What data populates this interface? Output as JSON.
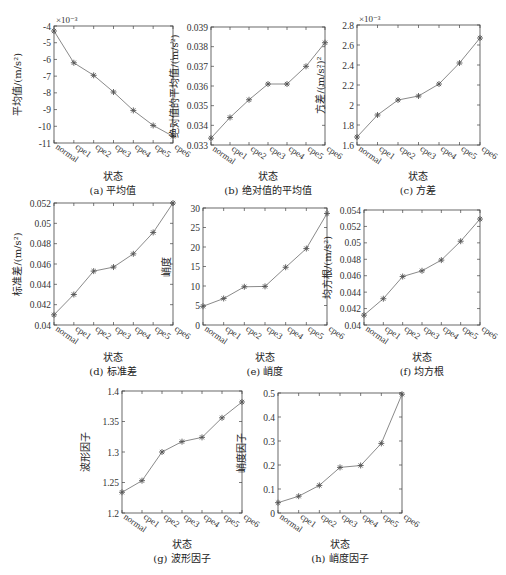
{
  "chart_data": [
    {
      "id": "a",
      "type": "line",
      "title": "",
      "caption": "(a) 平均值",
      "xlabel": "状态",
      "ylabel": "平均值/(m/s²)",
      "categories": [
        "normal",
        "cpe1",
        "cpe2",
        "cpe3",
        "cpe4",
        "cpe5",
        "cpe6"
      ],
      "values": [
        -4.3,
        -6.2,
        -6.95,
        -7.95,
        -9.05,
        -9.95,
        -10.6
      ],
      "exponent_label": "×10⁻³",
      "ylim": [
        -11,
        -4
      ],
      "yticks": [
        -4,
        -5,
        -6,
        -7,
        -8,
        -9,
        -10,
        -11
      ],
      "ytick_labels": [
        "-4",
        "-5",
        "-6",
        "-7",
        "-8",
        "-9",
        "-10",
        "-11"
      ],
      "marker": "asterisk",
      "grid": false
    },
    {
      "id": "b",
      "type": "line",
      "caption": "(b) 绝对值的平均值",
      "xlabel": "状态",
      "ylabel": "绝对值的平均值/(m/s²)",
      "categories": [
        "normal",
        "cpe1",
        "cpe2",
        "cpe3",
        "cpe4",
        "cpe5",
        "cpe6"
      ],
      "values": [
        0.03335,
        0.0344,
        0.0353,
        0.0361,
        0.0361,
        0.037,
        0.0382
      ],
      "ylim": [
        0.033,
        0.039
      ],
      "yticks": [
        0.033,
        0.034,
        0.035,
        0.036,
        0.037,
        0.038,
        0.039
      ],
      "ytick_labels": [
        "0.033",
        "0.034",
        "0.035",
        "0.036",
        "0.037",
        "0.038",
        "0.039"
      ],
      "marker": "asterisk",
      "grid": false
    },
    {
      "id": "c",
      "type": "line",
      "caption": "(c) 方差",
      "xlabel": "状态",
      "ylabel": "方差/(m/s²)²",
      "categories": [
        "normal",
        "cpe1",
        "cpe2",
        "cpe3",
        "cpe4",
        "cpe5",
        "cpe6"
      ],
      "values": [
        1.68,
        1.9,
        2.05,
        2.09,
        2.21,
        2.42,
        2.67
      ],
      "exponent_label": "×10⁻³",
      "ylim": [
        1.6,
        2.8
      ],
      "yticks": [
        1.6,
        1.8,
        2.0,
        2.2,
        2.4,
        2.6,
        2.8
      ],
      "ytick_labels": [
        "1.6",
        "1.8",
        "2",
        "2.2",
        "2.4",
        "2.6",
        "2.8"
      ],
      "marker": "asterisk",
      "grid": false
    },
    {
      "id": "d",
      "type": "line",
      "caption": "(d) 标准差",
      "xlabel": "状态",
      "ylabel": "标准差/(m/s²)",
      "categories": [
        "normal",
        "cpe1",
        "cpe2",
        "cpe3",
        "cpe4",
        "cpe5",
        "cpe6"
      ],
      "values": [
        0.041,
        0.043,
        0.0453,
        0.0457,
        0.047,
        0.0491,
        0.052
      ],
      "ylim": [
        0.04,
        0.052
      ],
      "yticks": [
        0.04,
        0.042,
        0.044,
        0.046,
        0.048,
        0.05,
        0.052
      ],
      "ytick_labels": [
        "0.04",
        "0.042",
        "0.044",
        "0.046",
        "0.048",
        "0.05",
        "0.052"
      ],
      "marker": "asterisk",
      "grid": false
    },
    {
      "id": "e",
      "type": "line",
      "caption": "(e) 峭度",
      "xlabel": "状态",
      "ylabel": "峭度",
      "categories": [
        "normal",
        "cpe1",
        "cpe2",
        "cpe3",
        "cpe4",
        "cpe5",
        "cpe6"
      ],
      "values": [
        4.8,
        6.8,
        9.8,
        9.9,
        14.8,
        19.6,
        28.6
      ],
      "ylim": [
        0,
        30
      ],
      "yticks": [
        0,
        5,
        10,
        15,
        20,
        25,
        30
      ],
      "ytick_labels": [
        "0",
        "5",
        "10",
        "15",
        "20",
        "25",
        "30"
      ],
      "marker": "asterisk",
      "grid": false
    },
    {
      "id": "f",
      "type": "line",
      "caption": "(f) 均方根",
      "xlabel": "状态",
      "ylabel": "均方根/(m/s²)",
      "categories": [
        "normal",
        "cpe1",
        "cpe2",
        "cpe3",
        "cpe4",
        "cpe5",
        "cpe6"
      ],
      "values": [
        0.0412,
        0.0432,
        0.0459,
        0.0466,
        0.0479,
        0.0502,
        0.0529
      ],
      "ylim": [
        0.04,
        0.054
      ],
      "yticks": [
        0.04,
        0.042,
        0.044,
        0.046,
        0.048,
        0.05,
        0.052,
        0.054
      ],
      "ytick_labels": [
        "0.04",
        "0.042",
        "0.044",
        "0.046",
        "0.048",
        "0.05",
        "0.052",
        "0.054"
      ],
      "marker": "asterisk",
      "grid": false
    },
    {
      "id": "g",
      "type": "line",
      "caption": "(g) 波形因子",
      "xlabel": "状态",
      "ylabel": "波形因子",
      "categories": [
        "normal",
        "cpe1",
        "cpe2",
        "cpe3",
        "cpe4",
        "cpe5",
        "cpe6"
      ],
      "values": [
        1.234,
        1.253,
        1.3,
        1.317,
        1.324,
        1.356,
        1.382
      ],
      "ylim": [
        1.2,
        1.4
      ],
      "yticks": [
        1.2,
        1.25,
        1.3,
        1.35,
        1.4
      ],
      "ytick_labels": [
        "1.2",
        "1.25",
        "1.3",
        "1.35",
        "1.4"
      ],
      "marker": "asterisk",
      "grid": false
    },
    {
      "id": "h",
      "type": "line",
      "caption": "(h) 峭度因子",
      "xlabel": "状态",
      "ylabel": "峭度因子",
      "categories": [
        "normal",
        "cpe1",
        "cpe2",
        "cpe3",
        "cpe4",
        "cpe5",
        "cpe6"
      ],
      "values": [
        0.043,
        0.07,
        0.115,
        0.19,
        0.198,
        0.29,
        0.495
      ],
      "ylim": [
        0,
        0.5
      ],
      "yticks": [
        0,
        0.1,
        0.2,
        0.3,
        0.4,
        0.5
      ],
      "ytick_labels": [
        "0",
        "0.1",
        "0.2",
        "0.3",
        "0.4",
        "0.5"
      ],
      "marker": "asterisk",
      "grid": false
    }
  ],
  "style": {
    "line_color": "#8a8a8a",
    "marker_color": "#555555",
    "axis_color": "#444444"
  }
}
